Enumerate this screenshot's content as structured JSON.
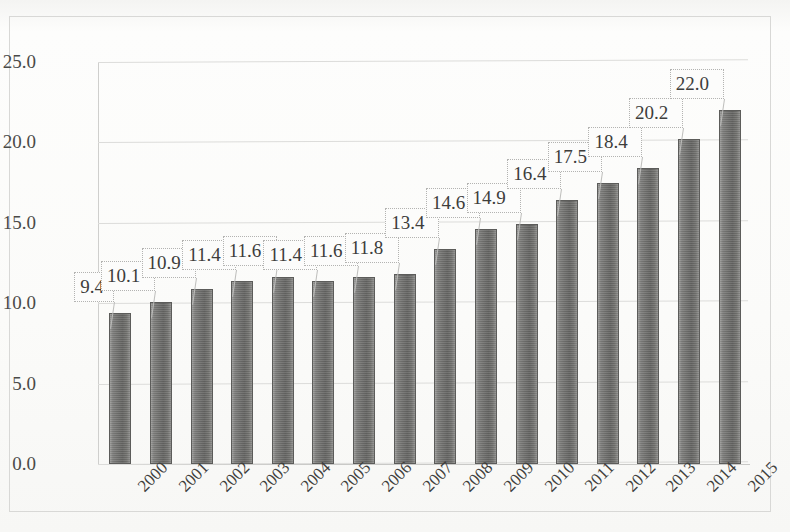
{
  "chart_data": {
    "type": "bar",
    "title": "",
    "subtitle": "",
    "xlabel": "",
    "ylabel": "",
    "categories": [
      "2000",
      "2001",
      "2002",
      "2003",
      "2004",
      "2005",
      "2006",
      "2007",
      "2008",
      "2009",
      "2010",
      "2011",
      "2012",
      "2013",
      "2014",
      "2015"
    ],
    "values": [
      9.4,
      10.1,
      10.9,
      11.4,
      11.6,
      11.4,
      11.6,
      11.8,
      13.4,
      14.6,
      14.9,
      16.4,
      17.5,
      18.4,
      20.2,
      22.0
    ],
    "data_labels": [
      "9.4",
      "10.1",
      "10.9",
      "11.4",
      "11.6",
      "11.4",
      "11.6",
      "11.8",
      "13.4",
      "14.6",
      "14.9",
      "16.4",
      "17.5",
      "18.4",
      "20.2",
      "22.0"
    ],
    "ylim": [
      0.0,
      25.0
    ],
    "yticks": [
      0.0,
      5.0,
      10.0,
      15.0,
      20.0,
      25.0
    ],
    "ytick_labels": [
      "0.0",
      "5.0",
      "10.0",
      "15.0",
      "20.0",
      "25.0"
    ],
    "grid": true,
    "grid_axis": "y",
    "legend": false,
    "legend_position": "none",
    "series_name": "",
    "bar_color": "#6e6e6c",
    "label_box_style": "callout-with-leader-line",
    "xtick_rotation": -45
  },
  "colors": {
    "bar_fill": "#6e6e6c",
    "bar_edge": "#5c5c5a",
    "gridline": "#dcdcda",
    "frame_border": "#d8d8d6",
    "text": "#3d3d3b",
    "background": "#fbfbfa",
    "callout_border": "#b3b3b1",
    "callout_fill": "#fcfcfb"
  }
}
